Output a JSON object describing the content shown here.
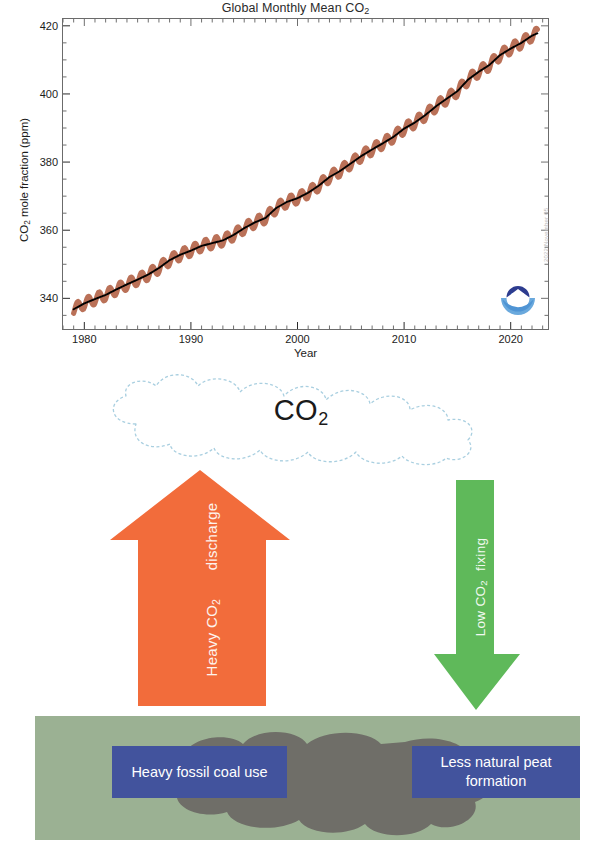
{
  "chart": {
    "title": "Global Monthly Mean CO2",
    "title_base": "Global Monthly Mean CO",
    "title_sub": "2",
    "ylabel_base": "CO",
    "ylabel_sub": "2",
    "ylabel_rest": " mole fraction (ppm)",
    "xlabel": "Year",
    "credit": "2022 November 05",
    "logo_name": "NOAA"
  },
  "chart_data": {
    "type": "line",
    "title": "Global Monthly Mean CO2",
    "xlabel": "Year",
    "ylabel": "CO2 mole fraction (ppm)",
    "xlim": [
      1978.0,
      2023.5
    ],
    "ylim": [
      331,
      422
    ],
    "xticks": [
      1980,
      1990,
      2000,
      2010,
      2020
    ],
    "yticks": [
      340,
      360,
      380,
      400,
      420
    ],
    "grid": false,
    "legend": null,
    "marker_color": "#b4654a",
    "trend_color": "#000000",
    "series": [
      {
        "name": "Monthly mean CO2 (seasonal cycle)",
        "style": "markers",
        "note": "Monthly values oscillate about the trend with a seasonal amplitude of roughly +/- 1.5 ppm",
        "seasonal_amplitude_ppm": 1.6
      },
      {
        "name": "Deseasonalized trend",
        "style": "line",
        "x": [
          1979,
          1980,
          1981,
          1982,
          1983,
          1984,
          1985,
          1986,
          1987,
          1988,
          1989,
          1990,
          1991,
          1992,
          1993,
          1994,
          1995,
          1996,
          1997,
          1998,
          1999,
          2000,
          2001,
          2002,
          2003,
          2004,
          2005,
          2006,
          2007,
          2008,
          2009,
          2010,
          2011,
          2012,
          2013,
          2014,
          2015,
          2016,
          2017,
          2018,
          2019,
          2020,
          2021,
          2022,
          2023
        ],
        "values": [
          336.8,
          338.5,
          339.8,
          341.0,
          342.6,
          344.1,
          345.5,
          347.0,
          348.9,
          351.2,
          352.8,
          354.0,
          355.4,
          356.2,
          357.0,
          358.6,
          360.6,
          362.3,
          363.6,
          366.5,
          368.3,
          369.4,
          371.0,
          373.1,
          375.6,
          377.4,
          379.6,
          381.8,
          383.7,
          385.5,
          387.4,
          389.8,
          391.6,
          393.8,
          396.4,
          398.6,
          400.8,
          404.2,
          406.5,
          408.5,
          411.4,
          413.3,
          415.0,
          417.1,
          418.5
        ],
        "units": "ppm"
      }
    ]
  },
  "cloud": {
    "label_base": "CO",
    "label_sub": "2",
    "outline_color": "#a9cfe0"
  },
  "arrows": {
    "up": {
      "label_base": "Heavy CO",
      "label_sub": "2",
      "label_rest": " discharge",
      "color": "#f26c3b",
      "direction": "up"
    },
    "down": {
      "label_base": "Low CO",
      "label_sub": "2",
      "label_rest": " fixing",
      "color": "#5fb95a",
      "direction": "down"
    }
  },
  "ground": {
    "color": "#9bb193",
    "blob_color": "#6f6e68",
    "boxes": [
      {
        "text": "Heavy fossil coal use",
        "color": "#42539d"
      },
      {
        "text": "Less natural peat formation",
        "color": "#42539d"
      }
    ]
  }
}
